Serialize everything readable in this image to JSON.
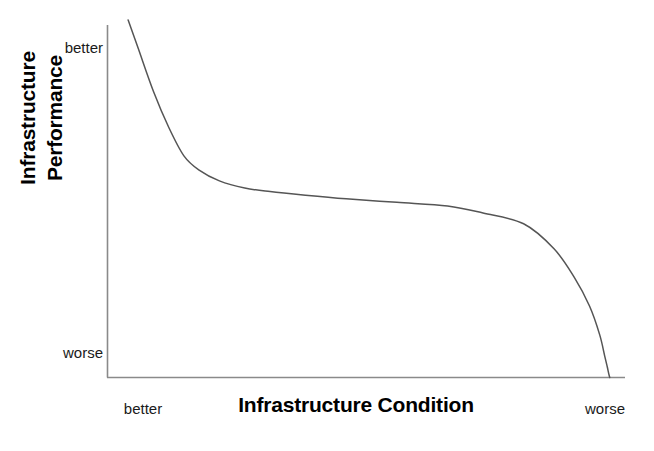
{
  "chart_data": {
    "type": "line",
    "title": "",
    "xlabel": "Infrastructure Condition",
    "ylabel_line1": "Infrastructure",
    "ylabel_line2": "Performance",
    "ylabel": "Infrastructure Performance",
    "x_tick_labels": [
      "better",
      "worse"
    ],
    "y_tick_labels": [
      "better",
      "worse"
    ],
    "grid": false,
    "legend": "none",
    "axis_color": "#8a8a8a",
    "curve_color": "#555555",
    "background": "#ffffff",
    "xlim": [
      0,
      100
    ],
    "ylim": [
      0,
      100
    ],
    "series": [
      {
        "name": "Infrastructure deterioration curve",
        "x": [
          2,
          4,
          7,
          10,
          13,
          16,
          20,
          25,
          30,
          37,
          45,
          55,
          65,
          72,
          80,
          86,
          90,
          93,
          95,
          96,
          96.5,
          96.8,
          97
        ],
        "y": [
          100,
          92,
          80,
          70,
          62,
          58,
          55,
          53,
          52,
          51,
          50,
          49,
          48,
          46,
          43,
          36,
          28,
          20,
          12,
          6,
          3,
          1,
          0
        ]
      }
    ],
    "annotation": "Performance declines slowly over most of the condition range, then drops sharply near the worse end."
  },
  "axes": {
    "x_axis_name": "infrastructure-condition-axis",
    "y_axis_name": "infrastructure-performance-axis"
  }
}
